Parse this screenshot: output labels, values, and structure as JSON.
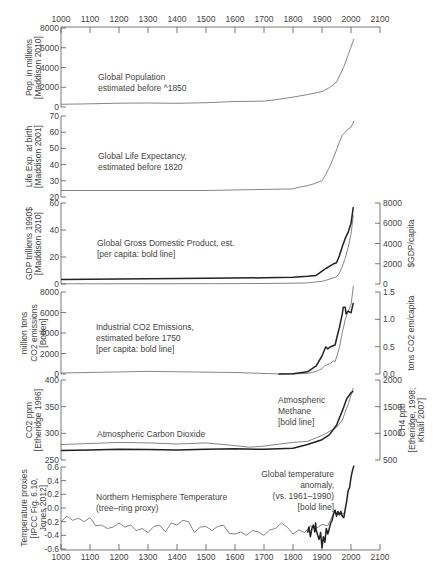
{
  "chart_data": {
    "type": "line",
    "x_axis": {
      "range": [
        1000,
        2100
      ],
      "ticks": [
        1000,
        1100,
        1200,
        1300,
        1400,
        1500,
        1600,
        1700,
        1800,
        1900,
        2000,
        2100
      ],
      "top_and_bottom": true
    },
    "panels": [
      {
        "id": "population",
        "ylabel": [
          "Pop. in millions",
          "[Maddison 2010]"
        ],
        "ylim": [
          0,
          8000
        ],
        "yticks": [
          0,
          2000,
          4000,
          6000,
          8000
        ],
        "annotation": [
          "Global Population",
          "estimated before ^1850"
        ],
        "series": [
          {
            "name": "Global Population",
            "style": "thin",
            "x": [
              1000,
              1100,
              1200,
              1300,
              1400,
              1500,
              1600,
              1700,
              1750,
              1800,
              1850,
              1900,
              1925,
              1950,
              1975,
              2000,
              2010
            ],
            "y": [
              270,
              320,
              380,
              400,
              370,
              440,
              560,
              600,
              780,
              1000,
              1260,
              1560,
              1950,
              2520,
              4070,
              6070,
              6900
            ]
          }
        ]
      },
      {
        "id": "life_expectancy",
        "ylabel": [
          "Life Exp. at birth",
          "[Maddison 2001]"
        ],
        "ylim": [
          20,
          70
        ],
        "yticks": [
          20,
          30,
          40,
          50,
          60,
          70
        ],
        "annotation": [
          "Global Life Expectancy,",
          "estimated before 1820"
        ],
        "series": [
          {
            "name": "Global Life Expectancy",
            "style": "thin",
            "x": [
              1000,
              1500,
              1800,
              1820,
              1850,
              1870,
              1900,
              1913,
              1930,
              1950,
              1960,
              1970,
              1980,
              1990,
              2000,
              2005,
              2010
            ],
            "y": [
              24,
              24,
              25,
              26,
              27,
              28,
              30,
              34,
              40,
              49,
              54,
              58,
              60,
              62,
              63,
              65,
              67
            ]
          }
        ]
      },
      {
        "id": "gdp",
        "ylabel": [
          "GDP trillions 1990$",
          "[Maddison 2010]"
        ],
        "ylim": [
          0,
          60
        ],
        "yticks": [
          0,
          20,
          40,
          60
        ],
        "ylabel_right": "$GDP/capita",
        "ylim_right": [
          0,
          8000
        ],
        "yticks_right": [
          0,
          2000,
          4000,
          6000,
          8000
        ],
        "annotation": [
          "Global Gross Domestic Product, est.",
          "[per capita: bold line]"
        ],
        "series": [
          {
            "name": "GDP (trillions 1990$)",
            "style": "thin",
            "axis": "left",
            "x": [
              1000,
              1500,
              1700,
              1800,
              1850,
              1900,
              1925,
              1950,
              1960,
              1970,
              1980,
              1990,
              2000,
              2008
            ],
            "y": [
              0.12,
              0.25,
              0.37,
              0.6,
              0.8,
              2.0,
              3.5,
              5.3,
              8.0,
              13.0,
              19.0,
              27.0,
              37.0,
              51.0
            ]
          },
          {
            "name": "GDP per capita",
            "style": "bold",
            "axis": "right",
            "x": [
              1000,
              1500,
              1700,
              1800,
              1850,
              1880,
              1900,
              1913,
              1925,
              1940,
              1950,
              1960,
              1970,
              1980,
              1990,
              2000,
              2008
            ],
            "y": [
              450,
              565,
              615,
              670,
              760,
              850,
              1260,
              1530,
              1750,
              2000,
              2100,
              2800,
              3700,
              4500,
              5100,
              6000,
              7600
            ]
          }
        ]
      },
      {
        "id": "co2_emissions",
        "ylabel": [
          "million tons",
          "CO2 emissions",
          "[Boden]"
        ],
        "ylim": [
          0,
          8000
        ],
        "yticks": [
          0,
          2000,
          4000,
          6000,
          8000
        ],
        "ylabel_right": "tons CO2 em/capita",
        "ylim_right": [
          0,
          1.5
        ],
        "yticks_right": [
          "0.0",
          "0.5",
          "1.0",
          "1.5"
        ],
        "annotation": [
          "Industrial CO2 Emissions,",
          "estimated before 1750",
          "[per capita: bold line]"
        ],
        "series": [
          {
            "name": "CO2 emissions (million tons)",
            "style": "thin",
            "axis": "left",
            "x": [
              1000,
              1300,
              1600,
              1750,
              1800,
              1850,
              1880,
              1900,
              1910,
              1920,
              1930,
              1940,
              1945,
              1950,
              1960,
              1970,
              1980,
              1990,
              2000,
              2005,
              2008
            ],
            "y": [
              100,
              250,
              150,
              10,
              10,
              55,
              240,
              530,
              820,
              930,
              1050,
              1300,
              1200,
              1630,
              2580,
              4050,
              5300,
              6100,
              6750,
              7900,
              8600
            ]
          },
          {
            "name": "CO2 per capita (tons)",
            "style": "bold",
            "axis": "right",
            "x": [
              1750,
              1800,
              1850,
              1880,
              1900,
              1913,
              1920,
              1930,
              1945,
              1950,
              1960,
              1970,
              1973,
              1980,
              1983,
              1990,
              2000,
              2008
            ],
            "y": [
              0.0,
              0.005,
              0.04,
              0.15,
              0.33,
              0.5,
              0.46,
              0.5,
              0.53,
              0.64,
              0.85,
              1.1,
              1.22,
              1.22,
              1.1,
              1.15,
              1.12,
              1.3
            ]
          }
        ]
      },
      {
        "id": "co2_ppm",
        "ylabel": [
          "CO2 ppm",
          "[Etheridge 1996]"
        ],
        "ylim": [
          250,
          400
        ],
        "yticks": [
          250,
          300,
          350,
          400
        ],
        "ylabel_right": [
          "CH4 ppb",
          "[Etheridge, 1998;",
          "Khalil 2007]"
        ],
        "ylim_right": [
          500,
          2000
        ],
        "yticks_right": [
          500,
          1000,
          1500,
          2000
        ],
        "annotation_co2": "Atmospheric Carbon Dioxide",
        "annotation_ch4": [
          "Atmospheric",
          "Methane",
          "[bold line]"
        ],
        "series": [
          {
            "name": "Atmospheric Carbon Dioxide (ppm)",
            "style": "thin",
            "axis": "left",
            "x": [
              1000,
              1100,
              1200,
              1300,
              1400,
              1500,
              1600,
              1650,
              1700,
              1800,
              1850,
              1900,
              1950,
              1970,
              1990,
              2008
            ],
            "y": [
              279,
              281,
              283,
              282,
              280,
              282,
              277,
              274,
              276,
              283,
              285,
              296,
              311,
              325,
              354,
              385
            ]
          },
          {
            "name": "Atmospheric Methane (ppb)",
            "style": "bold",
            "axis": "right",
            "x": [
              1000,
              1100,
              1200,
              1300,
              1400,
              1500,
              1600,
              1700,
              1800,
              1850,
              1900,
              1925,
              1950,
              1970,
              1985,
              2000,
              2008
            ],
            "y": [
              680,
              690,
              700,
              695,
              690,
              700,
              710,
              700,
              720,
              790,
              880,
              970,
              1150,
              1420,
              1650,
              1760,
              1790
            ]
          }
        ]
      },
      {
        "id": "temperature",
        "ylabel": [
          "Temperature proxies",
          "[IPCC Fig. 6.10,",
          "Jones 2012]"
        ],
        "ylim": [
          -0.6,
          0.6
        ],
        "yticks": [
          "-0.6",
          "-0.4",
          "-0.2",
          "-0.0",
          "0.2",
          "0.4",
          "0.6"
        ],
        "annotation_nh": [
          "Northern Hemisphere Temperature",
          "(tree–ring proxy)"
        ],
        "annotation_global": [
          "Global temperature",
          "anomaly,",
          "(vs. 1961–1990)",
          "[bold line]"
        ],
        "series": [
          {
            "name": "Northern Hemisphere Temperature (tree-ring proxy)",
            "style": "thin",
            "x": [
              1000,
              1020,
              1040,
              1060,
              1080,
              1100,
              1120,
              1140,
              1160,
              1180,
              1200,
              1220,
              1240,
              1260,
              1280,
              1300,
              1320,
              1340,
              1360,
              1380,
              1400,
              1420,
              1440,
              1460,
              1480,
              1500,
              1520,
              1540,
              1560,
              1580,
              1600,
              1620,
              1640,
              1660,
              1680,
              1700,
              1720,
              1740,
              1760,
              1780,
              1800,
              1820,
              1840,
              1860,
              1880,
              1900,
              1920,
              1940,
              1960,
              1980
            ],
            "y": [
              -0.2,
              -0.12,
              -0.18,
              -0.15,
              -0.2,
              -0.14,
              -0.26,
              -0.25,
              -0.3,
              -0.28,
              -0.22,
              -0.28,
              -0.25,
              -0.33,
              -0.3,
              -0.36,
              -0.27,
              -0.25,
              -0.35,
              -0.22,
              -0.25,
              -0.18,
              -0.2,
              -0.36,
              -0.28,
              -0.27,
              -0.33,
              -0.27,
              -0.25,
              -0.37,
              -0.38,
              -0.35,
              -0.4,
              -0.33,
              -0.35,
              -0.4,
              -0.32,
              -0.3,
              -0.22,
              -0.28,
              -0.38,
              -0.32,
              -0.36,
              -0.26,
              -0.3,
              -0.24,
              -0.26,
              -0.08,
              -0.1,
              -0.07
            ]
          },
          {
            "name": "Global temperature anomaly (vs. 1961-1990)",
            "style": "bold",
            "x": [
              1850,
              1855,
              1860,
              1865,
              1870,
              1875,
              1878,
              1880,
              1885,
              1890,
              1895,
              1900,
              1905,
              1910,
              1915,
              1920,
              1925,
              1930,
              1935,
              1940,
              1945,
              1950,
              1955,
              1960,
              1965,
              1970,
              1975,
              1980,
              1985,
              1990,
              1995,
              2000,
              2005,
              2010
            ],
            "y": [
              -0.36,
              -0.28,
              -0.42,
              -0.3,
              -0.25,
              -0.35,
              -0.22,
              -0.32,
              -0.4,
              -0.46,
              -0.36,
              -0.58,
              -0.42,
              -0.5,
              -0.3,
              -0.38,
              -0.3,
              -0.22,
              -0.18,
              -0.08,
              -0.03,
              -0.12,
              -0.05,
              -0.1,
              -0.05,
              -0.12,
              -0.14,
              -0.02,
              0.1,
              0.25,
              0.3,
              0.45,
              0.55,
              0.62
            ]
          }
        ]
      }
    ],
    "caption_visible_fragment": "Figure ..."
  }
}
